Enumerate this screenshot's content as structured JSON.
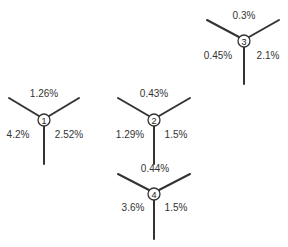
{
  "diagram": {
    "type": "three-way junction splits",
    "colors": {
      "line": "#333333",
      "text": "#333333",
      "background": "#ffffff"
    },
    "junctions": [
      {
        "id": "1",
        "top": "1.26%",
        "left": "4.2%",
        "right": "2.52%"
      },
      {
        "id": "2",
        "top": "0.43%",
        "left": "1.29%",
        "right": "1.5%"
      },
      {
        "id": "3",
        "top": "0.3%",
        "left": "0.45%",
        "right": "2.1%"
      },
      {
        "id": "4",
        "top": "0.44%",
        "left": "3.6%",
        "right": "1.5%"
      }
    ]
  }
}
